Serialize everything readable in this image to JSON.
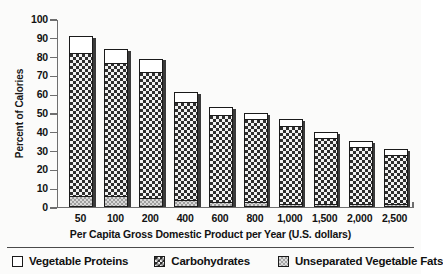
{
  "chart_data": {
    "type": "bar",
    "subtype": "stacked-bar",
    "title": "",
    "xlabel": "Per Capita Gross Domestic Product per Year (U.S. dollars)",
    "ylabel": "Percent of Calories",
    "categories": [
      "50",
      "100",
      "200",
      "400",
      "600",
      "800",
      "1,000",
      "1,500",
      "2,000",
      "2,500"
    ],
    "ylim": [
      0,
      100
    ],
    "yticks": [
      0,
      10,
      20,
      30,
      40,
      50,
      60,
      70,
      80,
      90,
      100
    ],
    "ytick_labels": [
      "0",
      "10",
      "20",
      "30",
      "40",
      "50",
      "60",
      "70",
      "80",
      "90",
      "100"
    ],
    "grid": false,
    "legend_position": "bottom",
    "stack_order_bottom_to_top": [
      "Unseparated Vegetable Fats",
      "Carbohydrates",
      "Vegetable Proteins"
    ],
    "series": [
      {
        "name": "Unseparated Vegetable Fats",
        "color": "#d8d8d8",
        "pattern": "fine-checker-gray",
        "values": [
          6,
          6,
          5,
          4,
          3,
          3,
          2,
          2,
          2,
          2
        ]
      },
      {
        "name": "Carbohydrates",
        "color": "#2e2e2e",
        "pattern": "bold-checker-dark",
        "values": [
          76,
          71,
          67,
          52,
          46,
          44,
          41,
          35,
          30,
          26
        ]
      },
      {
        "name": "Vegetable Proteins",
        "color": "#ffffff",
        "pattern": "solid-white",
        "values": [
          9,
          7,
          7,
          5,
          4,
          3,
          4,
          3,
          3,
          3
        ]
      }
    ],
    "totals": [
      91,
      84,
      79,
      61,
      53,
      50,
      47,
      40,
      35,
      31
    ],
    "segment_tops": {
      "fats_top": [
        6,
        6,
        5,
        4,
        3,
        3,
        2,
        2,
        2,
        2
      ],
      "carbs_top": [
        82,
        77,
        72,
        56,
        49,
        47,
        43,
        37,
        32,
        28
      ],
      "total_top": [
        91,
        84,
        79,
        61,
        53,
        50,
        47,
        40,
        35,
        31
      ]
    }
  },
  "axes": {
    "y_title": "Percent of Calories",
    "x_title": "Per Capita Gross Domestic Product per Year (U.S. dollars)"
  },
  "legend": {
    "items": [
      {
        "label": "Vegetable Proteins",
        "swatch": "protein"
      },
      {
        "label": "Carbohydrates",
        "swatch": "carb"
      },
      {
        "label": "Unseparated Vegetable Fats",
        "swatch": "fat"
      }
    ]
  },
  "colors": {
    "axis": "#6e6e6e",
    "bar_outline": "#1a1a1a",
    "protein_fill": "#ffffff",
    "carb_fill": "#2e2e2e",
    "fat_fill": "#d8d8d8",
    "background": "#fbfbfa",
    "text": "#111111"
  }
}
